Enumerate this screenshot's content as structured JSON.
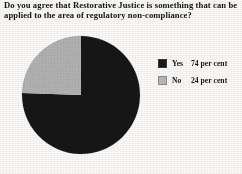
{
  "figure": {
    "title_line_1": "Do you agree that Restorative Justice is something that can be",
    "title_line_2": "applied to the area of regulatory non-compliance?"
  },
  "legend": {
    "position": "right",
    "rows": [
      {
        "key": "Yes",
        "value": "74 per cent",
        "color": "#181818",
        "swatch_name": "legend-swatch-yes"
      },
      {
        "key": "No",
        "value": "24 per cent",
        "color": "#b9b9b9",
        "swatch_name": "legend-swatch-no"
      }
    ]
  },
  "chart_data": {
    "type": "pie",
    "title": "Do you agree that Restorative Justice is something that can be applied to the area of regulatory non-compliance?",
    "xlabel": "",
    "ylabel": "",
    "unit": "per cent",
    "labels": [
      "Yes",
      "No"
    ],
    "values": [
      74,
      24
    ],
    "colors": [
      "#181818",
      "#b9b9b9"
    ],
    "start_angle_deg": 0,
    "direction": "clockwise",
    "legend": true,
    "legend_position": "right",
    "grid": false,
    "data_labels_shown": false,
    "slices": [
      {
        "label": "Yes",
        "value": 74,
        "display": "74 per cent",
        "color": "#181818"
      },
      {
        "label": "No",
        "value": 24,
        "display": "24 per cent",
        "color": "#b9b9b9"
      }
    ]
  }
}
